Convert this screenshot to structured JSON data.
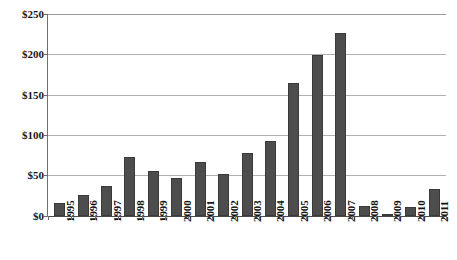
{
  "chart_data": {
    "type": "bar",
    "title": "",
    "subtitle": "",
    "xlabel": "",
    "ylabel": "",
    "categories": [
      "1995",
      "1996",
      "1997",
      "1998",
      "1999",
      "2000",
      "2001",
      "2002",
      "2003",
      "2004",
      "2005",
      "2006",
      "2007",
      "2008",
      "2009",
      "2010",
      "2011"
    ],
    "values": [
      15,
      25,
      36,
      73,
      55,
      46,
      66,
      51,
      77,
      92,
      165,
      199,
      227,
      12,
      2,
      11,
      33
    ],
    "series": [
      {
        "name": "",
        "values": [
          15,
          25,
          36,
          73,
          55,
          46,
          66,
          51,
          77,
          92,
          165,
          199,
          227,
          12,
          2,
          11,
          33
        ]
      }
    ],
    "ylim": [
      0,
      250
    ],
    "ytick_values": [
      0,
      50,
      100,
      150,
      200,
      250
    ],
    "ytick_labels": [
      "$0",
      "$50",
      "$100",
      "$150",
      "$200",
      "$250"
    ],
    "grid": true,
    "grid_axis": "y",
    "legend": false,
    "legend_position": "none",
    "bar_color": "#4d4d4d",
    "bar_edge_color": "#3a3a3a",
    "gridline_color": "#b0b0b0",
    "axis_color": "#6e6e6e",
    "xtick_rotation": 90,
    "currency_prefix": "$"
  }
}
